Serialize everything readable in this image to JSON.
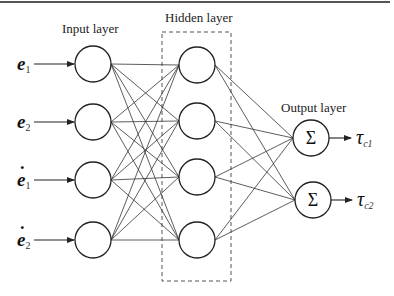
{
  "labels": {
    "input_layer": "Input layer",
    "hidden_layer": "Hidden layer",
    "output_layer": "Output layer"
  },
  "inputs": [
    {
      "symbol": "e",
      "dot": "",
      "subscript": "1"
    },
    {
      "symbol": "e",
      "dot": "",
      "subscript": "2"
    },
    {
      "symbol": "e",
      "dot": "˙",
      "subscript": "1"
    },
    {
      "symbol": "e",
      "dot": "˙",
      "subscript": "2"
    }
  ],
  "outputs": [
    {
      "symbol": "τ",
      "subscript": "c1",
      "node_symbol": "Σ"
    },
    {
      "symbol": "τ",
      "subscript": "c2",
      "node_symbol": "Σ"
    }
  ],
  "hidden_node_count": 4,
  "colors": {
    "stroke": "#222222",
    "edge": "#333333",
    "dashed_box": "#555555",
    "top_rule": "#555555"
  }
}
